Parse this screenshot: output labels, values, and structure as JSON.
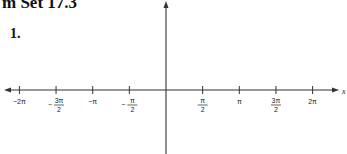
{
  "heading": "m Set 17.3",
  "problem_number": "1.",
  "chart_data": {
    "type": "line",
    "title": "",
    "function_label": "y = 2 cos x",
    "xlabel": "x",
    "ylabel": "",
    "xlim": [
      -6.5,
      6.9
    ],
    "ylim": [
      -2,
      2
    ],
    "x_ticks": [
      {
        "value": -6.2832,
        "label": "−2π"
      },
      {
        "value": -4.7124,
        "label_num": "3π",
        "label_den": "2",
        "sign": "−"
      },
      {
        "value": -3.1416,
        "label": "−π"
      },
      {
        "value": -1.5708,
        "label_num": "π",
        "label_den": "2",
        "sign": "−"
      },
      {
        "value": 1.5708,
        "label_num": "π",
        "label_den": "2",
        "sign": ""
      },
      {
        "value": 3.1416,
        "label": "π"
      },
      {
        "value": 4.7124,
        "label_num": "3π",
        "label_den": "2",
        "sign": ""
      },
      {
        "value": 6.2832,
        "label": "2π"
      }
    ],
    "y_ticks": [
      {
        "value": 2,
        "label": "2"
      },
      {
        "value": 1,
        "label": "1"
      },
      {
        "value": -1,
        "label": "−1"
      },
      {
        "value": -2,
        "label": "−2"
      }
    ],
    "series": [
      {
        "name": "y = 2 cos x",
        "x": [
          -6.2832,
          -4.7124,
          -3.1416,
          -1.5708,
          0,
          1.5708,
          3.1416,
          4.7124,
          6.2832
        ],
        "values": [
          2,
          0,
          -2,
          0,
          2,
          0,
          -2,
          0,
          2
        ]
      }
    ],
    "grid": false,
    "legend": "none"
  }
}
